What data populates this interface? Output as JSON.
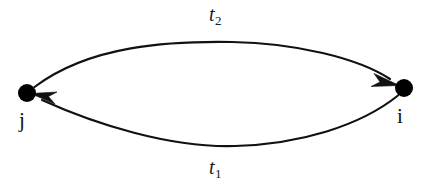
{
  "diagram": {
    "type": "directed-graph",
    "background_color": "#ffffff",
    "stroke_color": "#111111",
    "nodes": [
      {
        "id": "j",
        "label": "j",
        "x": 27,
        "y": 93,
        "radius": 9,
        "fill": "#000000"
      },
      {
        "id": "i",
        "label": "i",
        "x": 404,
        "y": 88,
        "radius": 9,
        "fill": "#000000"
      }
    ],
    "edges": [
      {
        "id": "edge-top",
        "label": "t",
        "label_subscript": "2",
        "from": "j",
        "to": "i",
        "direction": "left-to-right",
        "curvature": "arc-up",
        "apex_y": 42
      },
      {
        "id": "edge-bottom",
        "label": "t",
        "label_subscript": "1",
        "from": "i",
        "to": "j",
        "direction": "right-to-left",
        "curvature": "arc-down",
        "apex_y": 146
      }
    ]
  }
}
